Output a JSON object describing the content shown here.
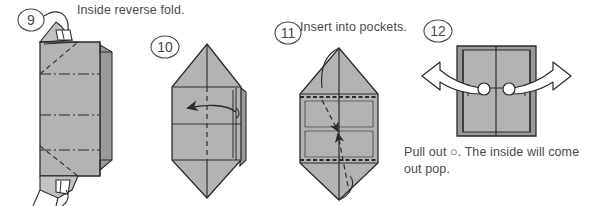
{
  "figure": {
    "background_color": "#ffffff",
    "paper_fill": "#b3b3b3",
    "paper_fill_dark": "#9a9a9a",
    "paper_fill_light": "#c2c2c2",
    "line_color": "#2b2b2b",
    "text_color": "#4a4a4a"
  },
  "steps": [
    {
      "number": "9",
      "label": "Inside reverse fold.",
      "shape": "tall rectangle with diagonal inside reverse folds at top and bottom",
      "fold_lines": "dashed valley diagonals, dash-dot horizontal crease lines"
    },
    {
      "number": "10",
      "label": "",
      "shape": "hexagonal / pointed top and bottom form",
      "arrow": "left pointing solid arrow across the face"
    },
    {
      "number": "11",
      "label": "Insert into pockets.",
      "shape": "hexagonal form with two inner square panels",
      "arrow": "two dashed arrows tucking flaps into center pockets"
    },
    {
      "number": "12",
      "label": "",
      "shape": "square finished form with two white pull dots",
      "arrow": "two white outlined arrows pulling outward left and right"
    }
  ],
  "captions": {
    "step9_label": "Inside reverse fold.",
    "step11_label": "Insert into pockets.",
    "step12_note_line1": "Pull out ○. The inside will come",
    "step12_note_line2": "out pop."
  }
}
